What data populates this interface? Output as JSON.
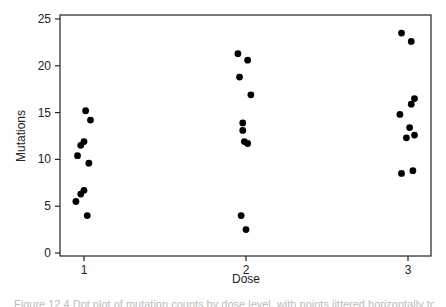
{
  "chart_data": {
    "type": "scatter",
    "title": "",
    "xlabel": "Dose",
    "ylabel": "Mutations",
    "xlim": [
      0.87,
      3.14
    ],
    "ylim": [
      -0.3,
      25.4
    ],
    "x_ticks": [
      1,
      2,
      3
    ],
    "y_ticks": [
      0,
      5,
      10,
      15,
      20,
      25
    ],
    "grid": false,
    "legend": null,
    "jitter": true,
    "series": [
      {
        "name": "Dose 1",
        "x": [
          1.01,
          1.04,
          1.0,
          0.98,
          0.96,
          1.03,
          1.0,
          0.98,
          0.95,
          1.02
        ],
        "y": [
          15.2,
          14.2,
          11.9,
          11.5,
          10.4,
          9.6,
          6.7,
          6.3,
          5.5,
          4.0
        ]
      },
      {
        "name": "Dose 2",
        "x": [
          1.95,
          2.01,
          1.96,
          2.03,
          1.98,
          1.98,
          1.99,
          2.01,
          1.97,
          2.0
        ],
        "y": [
          21.3,
          20.6,
          18.8,
          16.9,
          13.9,
          13.1,
          11.9,
          11.7,
          4.0,
          2.5
        ]
      },
      {
        "name": "Dose 3",
        "x": [
          2.96,
          3.02,
          3.04,
          3.02,
          2.95,
          3.01,
          3.04,
          2.99,
          3.03,
          2.96
        ],
        "y": [
          23.5,
          22.6,
          16.5,
          15.9,
          14.8,
          13.4,
          12.6,
          12.3,
          8.8,
          8.5
        ]
      }
    ]
  },
  "plot": {
    "xlabel": "Dose",
    "ylabel": "Mutations",
    "x_tick_labels": [
      "1",
      "2",
      "3"
    ],
    "y_tick_labels": [
      "0",
      "5",
      "10",
      "15",
      "20",
      "25"
    ],
    "point_color": "#000000",
    "frame_color": "#222222"
  },
  "caption": {
    "text": "Figure 12.4  Dot plot of mutation counts by dose level, with points jittered horizontally to reduce overlap."
  }
}
